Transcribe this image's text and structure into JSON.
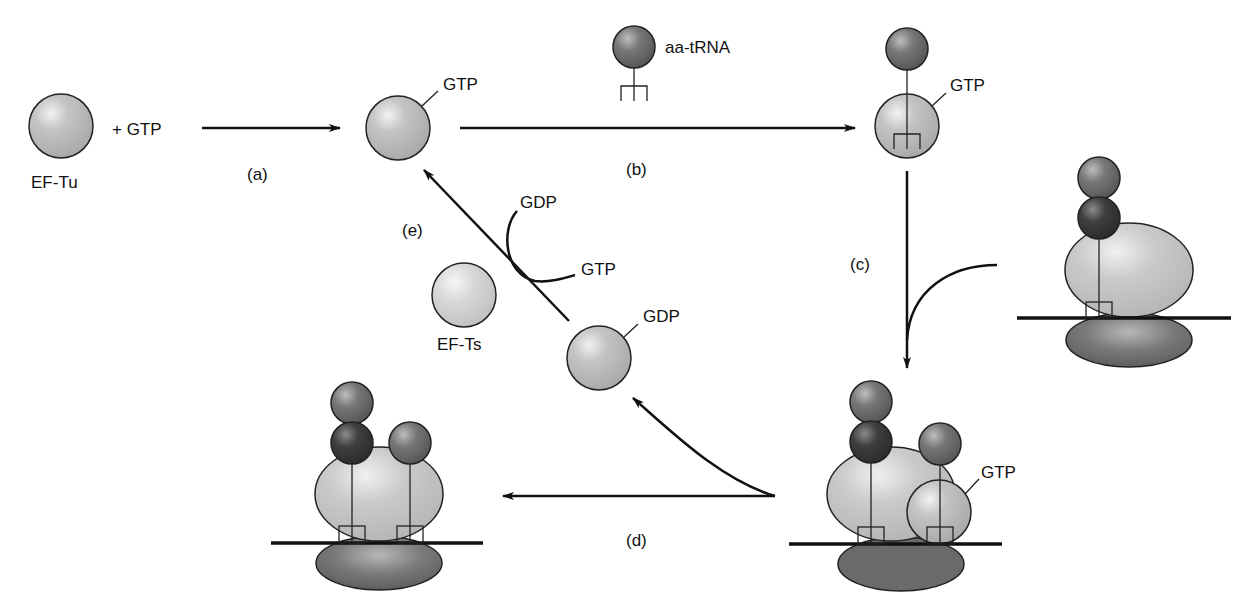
{
  "diagram": {
    "type": "cycle",
    "colors": {
      "ef_tu": "#bdbdbd",
      "ef_ts": "#d6d6d6",
      "aminoacid": "#6e6e6e",
      "peptidyl": "#3a3a3a",
      "ribosome_large": "#c4c4c4",
      "ribosome_small": "#6a6a6a",
      "line": "#111111"
    },
    "nodes": {
      "ef_tu_free": {
        "label": "EF-Tu"
      },
      "plus_gtp": {
        "label": "+ GTP"
      },
      "ef_tu_gtp": {
        "label": "GTP"
      },
      "aa_trna": {
        "label": "aa-tRNA"
      },
      "ternary_complex": {
        "label": "GTP"
      },
      "ribosome_bound": {
        "label": "GTP"
      },
      "ef_tu_gdp": {
        "label": "GDP"
      },
      "ef_ts": {
        "label": "EF-Ts"
      },
      "exchange_out": {
        "label": "GDP"
      },
      "exchange_in": {
        "label": "GTP"
      }
    },
    "steps": [
      {
        "id": "a",
        "label": "(a)"
      },
      {
        "id": "b",
        "label": "(b)"
      },
      {
        "id": "c",
        "label": "(c)"
      },
      {
        "id": "d",
        "label": "(d)"
      },
      {
        "id": "e",
        "label": "(e)"
      }
    ]
  }
}
